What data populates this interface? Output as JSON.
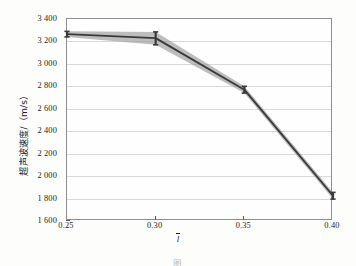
{
  "chart_data": {
    "type": "line",
    "title": "",
    "xlabel": "l̄",
    "ylabel": "超声波速度/（m/s）",
    "x": [
      0.25,
      0.3,
      0.35,
      0.4
    ],
    "xticklabels": [
      "0.25",
      "0.30",
      "0.35",
      "0.40"
    ],
    "xlim": [
      0.25,
      0.4
    ],
    "yticks": [
      1600,
      1800,
      2000,
      2200,
      2400,
      2600,
      2800,
      3000,
      3200,
      3400
    ],
    "yticklabels": [
      "1 600",
      "1 800",
      "2 000",
      "2 200",
      "2 400",
      "2 600",
      "2 800",
      "3 000",
      "3 200",
      "3 400"
    ],
    "ylim": [
      1600,
      3400
    ],
    "grid": "horizontal",
    "legend": "none",
    "series": [
      {
        "name": "超声波速度",
        "values": [
          3265,
          3230,
          2770,
          1825
        ],
        "error_low": [
          3240,
          3170,
          2740,
          1795
        ],
        "error_high": [
          3290,
          3285,
          2800,
          1855
        ],
        "line_color": "#3a3a3a",
        "band_color": "#9a9a9a",
        "marker": "error-bar-cap"
      }
    ]
  },
  "axis": {
    "y_title": "超声波速度/（m/s）",
    "x_title_base": "l",
    "x_title_full": "l̄"
  },
  "caption": {
    "text": "图"
  },
  "colors": {
    "line": "#3a3a3a",
    "band": "#9a9a9a",
    "grid": "#d9d9d9",
    "frame": "#8e8e8e",
    "page_background": "#fdfdfb",
    "plot_background": "#fefefe"
  }
}
